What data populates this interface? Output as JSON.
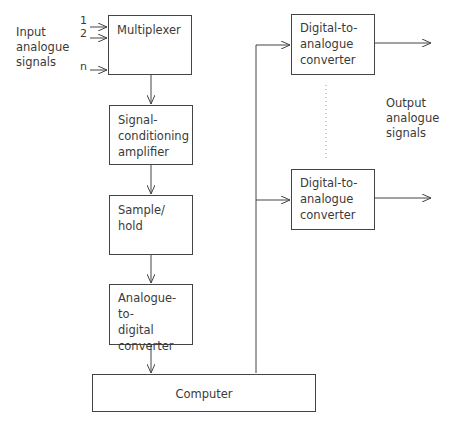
{
  "diagram": {
    "input_label": [
      "Input",
      "analogue",
      "signals"
    ],
    "input_channels": [
      "1",
      "2",
      "n"
    ],
    "output_label": [
      "Output",
      "analogue",
      "signals"
    ],
    "blocks": {
      "multiplexer": [
        "Multiplexer"
      ],
      "amplifier": [
        "Signal-",
        "conditioning",
        "amplifier"
      ],
      "sample_hold": [
        "Sample/",
        "hold"
      ],
      "adc": [
        "Analogue-to-",
        "digital",
        "converter"
      ],
      "computer": [
        "Computer"
      ],
      "dac1": [
        "Digital-to-",
        "analogue",
        "converter"
      ],
      "dac2": [
        "Digital-to-",
        "analogue",
        "converter"
      ]
    },
    "colors": {
      "line": "#444444",
      "text": "#3a3a3a",
      "background": "#ffffff"
    }
  }
}
